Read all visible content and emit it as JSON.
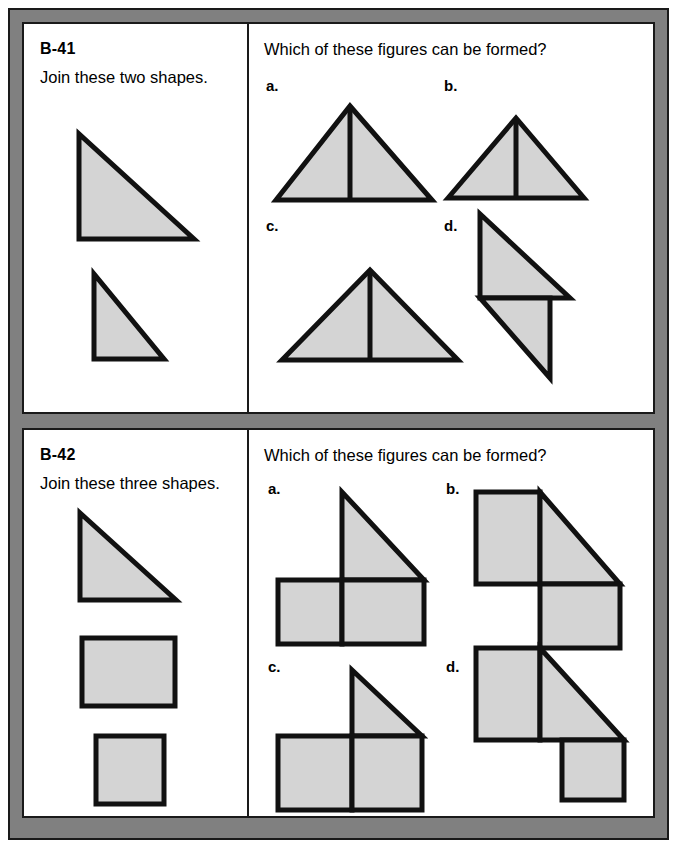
{
  "document": {
    "type": "worksheet",
    "background_color": "#ffffff",
    "frame_color": "#808080",
    "border_color": "#1a1a1a",
    "shape_fill": "#d4d4d4",
    "shape_stroke": "#111111"
  },
  "problems": [
    {
      "id": "B-41",
      "number": "B-41",
      "instruction": "Join these two shapes.",
      "question": "Which of these figures can be formed?",
      "given_shapes": [
        {
          "name": "large-right-triangle",
          "type": "right-triangle",
          "orientation": "right-angle-bottom-left"
        },
        {
          "name": "small-right-triangle",
          "type": "right-triangle",
          "orientation": "right-angle-bottom-left"
        }
      ],
      "options": [
        {
          "label": "a.",
          "key": "a",
          "description": "Scalene triangle split by vertical line, apex offset right"
        },
        {
          "label": "b.",
          "key": "b",
          "description": "Isosceles triangle split by vertical median line"
        },
        {
          "label": "c.",
          "key": "c",
          "description": "Wide isosceles triangle split by vertical median line"
        },
        {
          "label": "d.",
          "key": "d",
          "description": "Two right triangles joined corner to corner, stair arrangement"
        }
      ]
    },
    {
      "id": "B-42",
      "number": "B-42",
      "instruction": "Join these three shapes.",
      "question": "Which of these figures can be formed?",
      "given_shapes": [
        {
          "name": "right-triangle",
          "type": "right-triangle",
          "orientation": "right-angle-bottom-left"
        },
        {
          "name": "rectangle",
          "type": "rectangle"
        },
        {
          "name": "square",
          "type": "square"
        }
      ],
      "options": [
        {
          "label": "a.",
          "key": "a",
          "description": "Triangle on top-right of two squares side by side"
        },
        {
          "label": "b.",
          "key": "b",
          "description": "Square top-left, triangle right, square bottom-right"
        },
        {
          "label": "c.",
          "key": "c",
          "description": "Small triangle atop a wide rectangle split in two"
        },
        {
          "label": "d.",
          "key": "d",
          "description": "Rectangle top-left, large triangle right, square bottom-right"
        }
      ]
    }
  ]
}
